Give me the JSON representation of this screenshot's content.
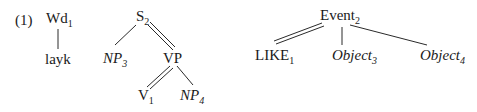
{
  "example_number": "(1)",
  "trees": [
    {
      "name": "word-tree",
      "nodes": [
        {
          "id": "wd",
          "label": "Wd",
          "sub": "1",
          "italic": false
        },
        {
          "id": "layk",
          "label": "layk",
          "sub": "",
          "italic": false
        }
      ],
      "edges": [
        {
          "from": "wd",
          "to": "layk",
          "type": "single"
        }
      ]
    },
    {
      "name": "syntax-tree",
      "nodes": [
        {
          "id": "s",
          "label": "S",
          "sub": "2",
          "italic": false
        },
        {
          "id": "np3",
          "label": "NP",
          "sub": "3",
          "italic": true
        },
        {
          "id": "vp",
          "label": "VP",
          "sub": "",
          "italic": false
        },
        {
          "id": "v",
          "label": "V",
          "sub": "1",
          "italic": false
        },
        {
          "id": "np4",
          "label": "NP",
          "sub": "4",
          "italic": true
        }
      ],
      "edges": [
        {
          "from": "s",
          "to": "np3",
          "type": "single"
        },
        {
          "from": "s",
          "to": "vp",
          "type": "double"
        },
        {
          "from": "vp",
          "to": "v",
          "type": "double"
        },
        {
          "from": "vp",
          "to": "np4",
          "type": "single"
        }
      ]
    },
    {
      "name": "semantic-tree",
      "nodes": [
        {
          "id": "event",
          "label": "Event",
          "sub": "2",
          "italic": false
        },
        {
          "id": "like",
          "label": "LIKE",
          "sub": "1",
          "italic": false
        },
        {
          "id": "obj3",
          "label": "Object",
          "sub": "3",
          "italic": true
        },
        {
          "id": "obj4",
          "label": "Object",
          "sub": "4",
          "italic": true
        }
      ],
      "edges": [
        {
          "from": "event",
          "to": "like",
          "type": "double"
        },
        {
          "from": "event",
          "to": "obj3",
          "type": "single"
        },
        {
          "from": "event",
          "to": "obj4",
          "type": "single"
        }
      ]
    }
  ]
}
